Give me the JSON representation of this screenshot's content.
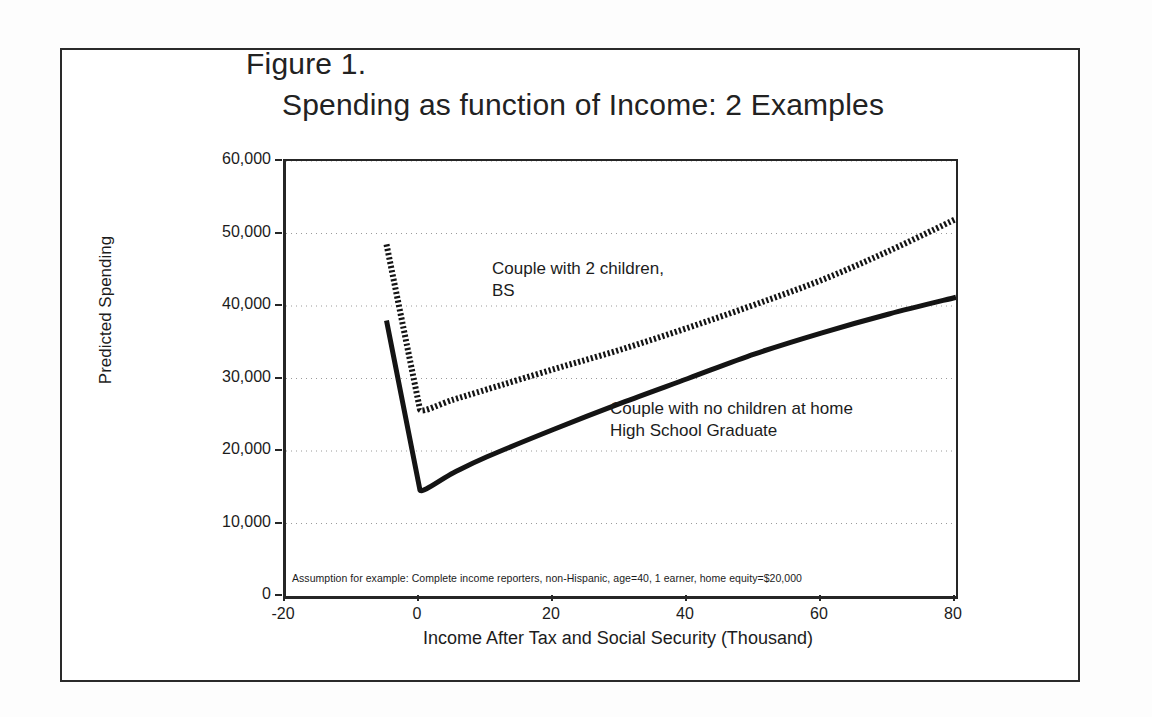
{
  "figure": {
    "title_line_1": "Figure 1.",
    "title_line_2": "Spending as function of Income: 2 Examples",
    "footnote": "Assumption for example: Complete income reporters,  non-Hispanic, age=40, 1 earner, home equity=$20,000"
  },
  "chart_data": {
    "type": "line",
    "title": "Figure 1. Spending as function of Income: 2 Examples",
    "xlabel": "Income After Tax and Social Security (Thousand)",
    "ylabel": "Predicted Spending",
    "xlim": [
      -20,
      80
    ],
    "ylim": [
      0,
      60000
    ],
    "xticks": [
      -20,
      0,
      20,
      40,
      60,
      80
    ],
    "xtick_labels": [
      "-20",
      "0",
      "20",
      "40",
      "60",
      "80"
    ],
    "yticks": [
      0,
      10000,
      20000,
      30000,
      40000,
      50000,
      60000
    ],
    "ytick_labels": [
      "0",
      "10,000",
      "20,000",
      "30,000",
      "40,000",
      "50,000",
      "60,000"
    ],
    "grid": true,
    "grid_style": "dotted horizontal",
    "legend": "annotations in plot",
    "series": [
      {
        "name": "Couple with 2 children, BS",
        "label": "Couple with 2 children,\nBS",
        "style": "dotted",
        "color": "#141414",
        "x": [
          -5,
          0,
          5,
          10,
          20,
          30,
          40,
          50,
          60,
          70,
          80
        ],
        "y": [
          48500,
          25700,
          27100,
          28500,
          31300,
          34000,
          37000,
          40200,
          43600,
          47600,
          52000
        ]
      },
      {
        "name": "Couple with no children at home, High School Graduate",
        "label": "Couple with no children at home\nHigh School Graduate",
        "style": "solid",
        "color": "#141414",
        "x": [
          -5,
          0,
          5,
          10,
          20,
          30,
          40,
          50,
          60,
          70,
          80
        ],
        "y": [
          38000,
          14600,
          17000,
          19200,
          23000,
          26600,
          30000,
          33400,
          36300,
          38900,
          41200
        ]
      }
    ]
  },
  "axes": {
    "y_ticks": [
      {
        "label": "60,000",
        "value": 60000
      },
      {
        "label": "50,000",
        "value": 50000
      },
      {
        "label": "40,000",
        "value": 40000
      },
      {
        "label": "30,000",
        "value": 30000
      },
      {
        "label": "20,000",
        "value": 20000
      },
      {
        "label": "10,000",
        "value": 10000
      },
      {
        "label": "0",
        "value": 0
      }
    ],
    "x_ticks": [
      {
        "label": "-20",
        "value": -20
      },
      {
        "label": "0",
        "value": 0
      },
      {
        "label": "20",
        "value": 20
      },
      {
        "label": "40",
        "value": 40
      },
      {
        "label": "60",
        "value": 60
      },
      {
        "label": "80",
        "value": 80
      }
    ],
    "y_title": "Predicted Spending",
    "x_title": "Income After Tax and Social Security (Thousand)"
  },
  "annotations": {
    "dotted_series": "Couple with 2 children,\nBS",
    "solid_series": "Couple with no children at home\nHigh School Graduate"
  }
}
